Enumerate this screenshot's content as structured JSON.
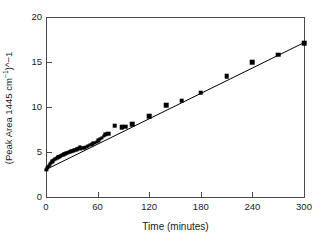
{
  "figure": {
    "background_color": "#ffffff",
    "marker_color": "#000000",
    "line_color": "#000000",
    "axis_color": "#4a4a4a"
  },
  "axes": {
    "xlabel": "Time (minutes)",
    "ylabel_plain": "(Peak Area 1445 cm-1)^-1",
    "ylabel_prefix": "(Peak Area 1445 cm",
    "ylabel_sup1": "−1",
    "ylabel_mid": ")^",
    "ylabel_sup2": "",
    "ylabel_suffix": "−1",
    "xticks": [
      "0",
      "60",
      "120",
      "180",
      "240",
      "300"
    ],
    "yticks": [
      "0",
      "5",
      "10",
      "15",
      "20"
    ]
  },
  "chart_data": {
    "type": "scatter",
    "title": "",
    "subtitle": "",
    "xlabel": "Time (minutes)",
    "ylabel": "(Peak Area 1445 cm⁻¹)^−1",
    "xlim": [
      0,
      300
    ],
    "ylim": [
      0,
      20
    ],
    "xticks": [
      0,
      60,
      120,
      180,
      240,
      300
    ],
    "yticks": [
      0,
      5,
      10,
      15,
      20
    ],
    "grid": false,
    "legend": false,
    "legend_position": "none",
    "marker": "filled-square",
    "series": [
      {
        "name": "Inverse peak area at 1445 cm^-1",
        "marker_size_small": 3.2,
        "marker_size_large": 4.6,
        "points": [
          {
            "x": 0.5,
            "y": 3.05,
            "size": "small"
          },
          {
            "x": 1.5,
            "y": 3.2,
            "size": "small"
          },
          {
            "x": 2.5,
            "y": 3.35,
            "size": "small"
          },
          {
            "x": 3.5,
            "y": 3.5,
            "size": "small"
          },
          {
            "x": 4.5,
            "y": 3.63,
            "size": "small"
          },
          {
            "x": 5.5,
            "y": 3.75,
            "size": "small"
          },
          {
            "x": 6.5,
            "y": 3.86,
            "size": "small"
          },
          {
            "x": 7.5,
            "y": 3.96,
            "size": "small"
          },
          {
            "x": 8.5,
            "y": 4.05,
            "size": "small"
          },
          {
            "x": 9.5,
            "y": 4.13,
            "size": "small"
          },
          {
            "x": 10.5,
            "y": 4.2,
            "size": "small"
          },
          {
            "x": 11.5,
            "y": 4.27,
            "size": "small"
          },
          {
            "x": 12.5,
            "y": 4.33,
            "size": "small"
          },
          {
            "x": 13.5,
            "y": 4.39,
            "size": "small"
          },
          {
            "x": 14.5,
            "y": 4.45,
            "size": "small"
          },
          {
            "x": 15.5,
            "y": 4.5,
            "size": "small"
          },
          {
            "x": 16.5,
            "y": 4.55,
            "size": "small"
          },
          {
            "x": 17.5,
            "y": 4.6,
            "size": "small"
          },
          {
            "x": 18.5,
            "y": 4.65,
            "size": "small"
          },
          {
            "x": 19.5,
            "y": 4.7,
            "size": "small"
          },
          {
            "x": 20.5,
            "y": 4.74,
            "size": "small"
          },
          {
            "x": 21.5,
            "y": 4.78,
            "size": "small"
          },
          {
            "x": 22.5,
            "y": 4.82,
            "size": "small"
          },
          {
            "x": 23.5,
            "y": 4.86,
            "size": "small"
          },
          {
            "x": 24.5,
            "y": 4.9,
            "size": "small"
          },
          {
            "x": 25.5,
            "y": 4.94,
            "size": "small"
          },
          {
            "x": 26.5,
            "y": 4.97,
            "size": "small"
          },
          {
            "x": 27.5,
            "y": 5.01,
            "size": "small"
          },
          {
            "x": 28.5,
            "y": 5.04,
            "size": "small"
          },
          {
            "x": 29.5,
            "y": 5.08,
            "size": "small"
          },
          {
            "x": 30.5,
            "y": 5.11,
            "size": "small"
          },
          {
            "x": 31.5,
            "y": 5.14,
            "size": "small"
          },
          {
            "x": 32.5,
            "y": 5.18,
            "size": "small"
          },
          {
            "x": 33.5,
            "y": 5.21,
            "size": "small"
          },
          {
            "x": 34.5,
            "y": 5.24,
            "size": "small"
          },
          {
            "x": 35.5,
            "y": 5.28,
            "size": "small"
          },
          {
            "x": 36.5,
            "y": 5.32,
            "size": "small"
          },
          {
            "x": 37.5,
            "y": 5.36,
            "size": "small"
          },
          {
            "x": 38.5,
            "y": 5.45,
            "size": "small"
          },
          {
            "x": 39.5,
            "y": 5.52,
            "size": "small"
          },
          {
            "x": 41.0,
            "y": 5.4,
            "size": "small"
          },
          {
            "x": 42.5,
            "y": 5.42,
            "size": "small"
          },
          {
            "x": 44.0,
            "y": 5.45,
            "size": "small"
          },
          {
            "x": 45.5,
            "y": 5.48,
            "size": "small"
          },
          {
            "x": 47.0,
            "y": 5.55,
            "size": "small"
          },
          {
            "x": 49.0,
            "y": 5.65,
            "size": "small"
          },
          {
            "x": 51.0,
            "y": 5.75,
            "size": "small"
          },
          {
            "x": 53.0,
            "y": 5.85,
            "size": "small"
          },
          {
            "x": 55.0,
            "y": 5.95,
            "size": "small"
          },
          {
            "x": 57.0,
            "y": 6.05,
            "size": "small"
          },
          {
            "x": 59.0,
            "y": 6.15,
            "size": "small"
          },
          {
            "x": 61.0,
            "y": 6.28,
            "size": "small"
          },
          {
            "x": 63.0,
            "y": 6.42,
            "size": "small"
          },
          {
            "x": 65.0,
            "y": 6.58,
            "size": "small"
          },
          {
            "x": 67.0,
            "y": 6.75,
            "size": "small"
          },
          {
            "x": 69.0,
            "y": 6.95,
            "size": "small"
          },
          {
            "x": 72.0,
            "y": 7.05,
            "size": "large"
          },
          {
            "x": 80.0,
            "y": 7.9,
            "size": "large"
          },
          {
            "x": 88.0,
            "y": 7.75,
            "size": "large"
          },
          {
            "x": 92.0,
            "y": 7.8,
            "size": "large"
          },
          {
            "x": 100.0,
            "y": 8.1,
            "size": "large"
          },
          {
            "x": 120.0,
            "y": 8.95,
            "size": "large"
          },
          {
            "x": 140.0,
            "y": 10.2,
            "size": "large"
          },
          {
            "x": 158.0,
            "y": 10.7,
            "size": "large"
          },
          {
            "x": 180.0,
            "y": 11.6,
            "size": "large"
          },
          {
            "x": 210.0,
            "y": 13.45,
            "size": "large"
          },
          {
            "x": 240.0,
            "y": 14.95,
            "size": "large"
          },
          {
            "x": 270.0,
            "y": 15.8,
            "size": "large"
          },
          {
            "x": 300.0,
            "y": 17.1,
            "size": "large"
          }
        ]
      }
    ],
    "fit_line": {
      "name": "linear fit",
      "x_start": 0,
      "y_start": 3.05,
      "x_end": 300,
      "y_end": 17.15,
      "slope": 0.047,
      "intercept": 3.05
    }
  }
}
